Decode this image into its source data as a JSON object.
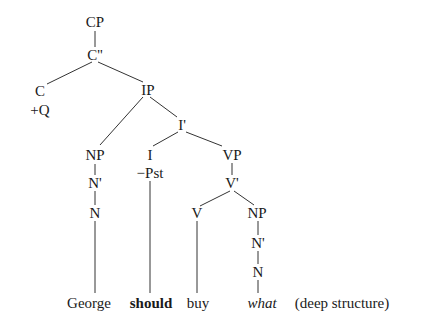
{
  "diagram": {
    "type": "syntax-tree",
    "nodes": {
      "cp": "CP",
      "cbar": "C''",
      "c": "C",
      "c_feature": "+Q",
      "ip": "IP",
      "ibar": "I'",
      "np_subj": "NP",
      "nbar_subj": "N'",
      "n_subj": "N",
      "i": "I",
      "i_feature": "−Pst",
      "vp": "VP",
      "vbar": "V'",
      "v": "V",
      "np_obj": "NP",
      "nbar_obj": "N'",
      "n_obj": "N"
    },
    "words": {
      "george": "George",
      "should": "should",
      "buy": "buy",
      "what": "what",
      "annotation": "(deep structure)"
    }
  }
}
